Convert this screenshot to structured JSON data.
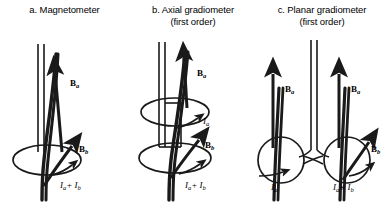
{
  "figure": {
    "background_color": "#ffffff",
    "stroke_color": "#1a1a1a",
    "width": 387,
    "height": 209
  },
  "panels": [
    {
      "id": "magnetometer",
      "caption_line1": "a. Magnetometer",
      "caption_line2": "",
      "loops": 1,
      "labels": {
        "field_upper": "B",
        "field_upper_sub": "a",
        "field_lower": "B",
        "field_lower_sub": "b",
        "current_lower": "I",
        "current_lower_sub": "a",
        "current_lower_plus": "+ I",
        "current_lower_sub2": "b"
      }
    },
    {
      "id": "axial-gradiometer",
      "caption_line1": "b. Axial gradiometer",
      "caption_line2": "(first order)",
      "loops": 2,
      "labels": {
        "field_upper": "B",
        "field_upper_sub": "a",
        "field_lower": "B",
        "field_lower_sub": "b",
        "current_upper": "I",
        "current_upper_sub": "a",
        "current_lower": "I",
        "current_lower_sub": "a",
        "current_lower_plus": "+ I",
        "current_lower_sub2": "b"
      }
    },
    {
      "id": "planar-gradiometer",
      "caption_line1": "c. Planar gradiometer",
      "caption_line2": "(first order)",
      "loops": 2,
      "labels": {
        "field_left": "B",
        "field_left_sub": "a",
        "field_right": "B",
        "field_right_sub": "a",
        "field_lower": "B",
        "field_lower_sub": "b",
        "current_left": "I",
        "current_left_sub": "a",
        "current_right": "I",
        "current_right_sub": "a",
        "current_right_plus": "+ I",
        "current_right_sub2": "b"
      }
    }
  ]
}
